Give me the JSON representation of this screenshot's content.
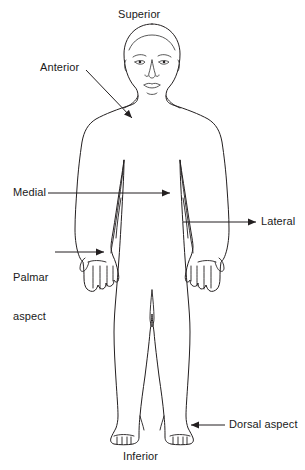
{
  "diagram": {
    "view": "Anterior view of standing human body",
    "stroke_color": "#231f20",
    "background_color": "#ffffff",
    "width": 305,
    "height": 470,
    "labels": [
      {
        "id": "superior",
        "text": "Superior",
        "position": "top-center",
        "has_leader": false,
        "meaning": "toward the head / upper part of the body"
      },
      {
        "id": "anterior",
        "text": "Anterior",
        "position": "upper-left",
        "has_leader": true,
        "arrow_direction": "down-right",
        "points_to": "chest / front of torso",
        "meaning": "front surface of the body"
      },
      {
        "id": "medial",
        "text": "Medial",
        "position": "middle-left",
        "has_leader": true,
        "arrow_direction": "right",
        "points_to": "midline of the body",
        "meaning": "toward the midline"
      },
      {
        "id": "lateral",
        "text": "Lateral",
        "position": "middle-right",
        "has_leader": true,
        "arrow_direction": "right",
        "points_to": "outer side of the body",
        "meaning": "away from the midline"
      },
      {
        "id": "palmar-aspect",
        "text": "Palmar\naspect",
        "line_1": "Palmar",
        "line_2": "aspect",
        "position": "lower-left",
        "has_leader": true,
        "arrow_direction": "right",
        "points_to": "palm of the left hand",
        "meaning": "palm surface of the hand"
      },
      {
        "id": "dorsal-aspect",
        "text": "Dorsal aspect",
        "position": "bottom-right",
        "has_leader": true,
        "arrow_direction": "left",
        "points_to": "top surface of the right foot",
        "meaning": "upper/back surface"
      },
      {
        "id": "inferior",
        "text": "Inferior",
        "position": "bottom-center",
        "has_leader": false,
        "meaning": "toward the feet / lower part of the body"
      }
    ]
  }
}
